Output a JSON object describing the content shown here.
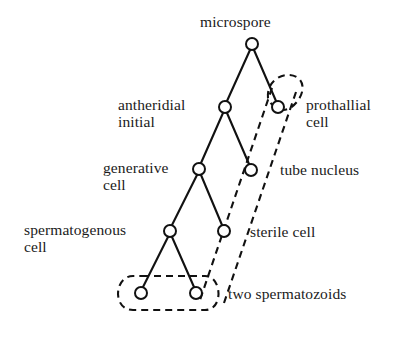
{
  "diagram": {
    "style": {
      "line_color": "#111111",
      "node_stroke": "#111111",
      "node_fill": "#ffffff",
      "dashed_color": "#111111",
      "background": "#ffffff"
    },
    "nodes": [
      {
        "id": "microspore",
        "label": "microspore",
        "cx": 252,
        "cy": 44,
        "r": 6
      },
      {
        "id": "antheridial",
        "label": "antheridial\ninitial",
        "cx": 225,
        "cy": 107,
        "r": 6
      },
      {
        "id": "prothallial",
        "label": "prothallial\ncell",
        "cx": 278,
        "cy": 107,
        "r": 6
      },
      {
        "id": "generative",
        "label": "generative\ncell",
        "cx": 199,
        "cy": 169,
        "r": 6
      },
      {
        "id": "tube-nucleus",
        "label": "tube nucleus",
        "cx": 251,
        "cy": 170,
        "r": 6
      },
      {
        "id": "spermatogenous",
        "label": "spermatogenous\ncell",
        "cx": 170,
        "cy": 231,
        "r": 6
      },
      {
        "id": "sterile",
        "label": "sterile cell",
        "cx": 224,
        "cy": 231,
        "r": 6
      },
      {
        "id": "spermatozoid-left",
        "label": "",
        "cx": 141,
        "cy": 293,
        "r": 6
      },
      {
        "id": "spermatozoid-right",
        "label": "",
        "cx": 196,
        "cy": 293,
        "r": 6
      }
    ],
    "edges": [
      {
        "from": "microspore",
        "to": "antheridial"
      },
      {
        "from": "microspore",
        "to": "prothallial"
      },
      {
        "from": "antheridial",
        "to": "generative"
      },
      {
        "from": "antheridial",
        "to": "tube-nucleus"
      },
      {
        "from": "generative",
        "to": "spermatogenous"
      },
      {
        "from": "generative",
        "to": "sterile"
      },
      {
        "from": "spermatogenous",
        "to": "spermatozoid-left"
      },
      {
        "from": "spermatogenous",
        "to": "spermatozoid-right"
      }
    ],
    "labels": [
      {
        "id": "label-microspore",
        "text": "microspore",
        "x": 200,
        "y": 13,
        "align": "left"
      },
      {
        "id": "label-antheridial",
        "text": "antheridial\ninitial",
        "x": 118,
        "y": 96,
        "align": "left"
      },
      {
        "id": "label-prothallial",
        "text": "prothallial\ncell",
        "x": 306,
        "y": 96,
        "align": "left"
      },
      {
        "id": "label-generative",
        "text": "generative\ncell",
        "x": 103,
        "y": 159,
        "align": "left"
      },
      {
        "id": "label-tube-nucleus",
        "text": "tube nucleus",
        "x": 280,
        "y": 161,
        "align": "left"
      },
      {
        "id": "label-spermatogenous",
        "text": "spermatogenous\ncell",
        "x": 24,
        "y": 221,
        "align": "left"
      },
      {
        "id": "label-sterile",
        "text": "sterile cell",
        "x": 250,
        "y": 223,
        "align": "left"
      },
      {
        "id": "label-spermatozoids",
        "text": "two spermatozoids",
        "x": 228,
        "y": 285,
        "align": "left"
      }
    ],
    "enclosures": [
      {
        "id": "prothallial-loop",
        "note": "dashed loop around prothallial cell"
      },
      {
        "id": "tube-nucleus-loop",
        "note": "dashed enclosure along tube nucleus and sterile cell down to spermatozoids"
      },
      {
        "id": "spermatozoid-loop",
        "note": "dashed loop around the two spermatozoids"
      }
    ]
  }
}
